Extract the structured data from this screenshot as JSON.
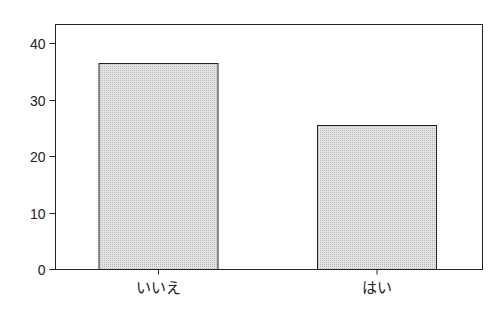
{
  "chart_data": {
    "type": "bar",
    "title": "",
    "xlabel": "",
    "ylabel": "",
    "categories": [
      "いいえ",
      "はい"
    ],
    "values": [
      36.5,
      25.5
    ],
    "ylim": [
      0,
      43.3
    ],
    "yticks": [
      0,
      10,
      20,
      30,
      40
    ],
    "ytick_labels": [
      "0",
      "10",
      "20",
      "30",
      "40"
    ],
    "grid": false,
    "legend": null,
    "colors": {
      "bar_fill": "#d8d8d8",
      "bar_stroke": "#222222",
      "axis": "#222222",
      "background": "#ffffff"
    }
  }
}
